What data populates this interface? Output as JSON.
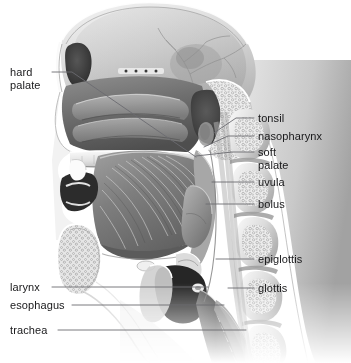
{
  "figure": {
    "name": "Mid-sagittal section of the head and neck during swallowing",
    "style": "grayscale medical illustration",
    "background_color": "#ffffff",
    "label_text_color": "#18181a",
    "leader_line_color": "#6b6b70",
    "width": 351,
    "height": 363
  },
  "labels": [
    {
      "id": "hard-palate",
      "text": "hard\npalate",
      "side": "left",
      "x": 10,
      "y": 66,
      "line": [
        [
          52,
          72
        ],
        [
          72,
          72
        ],
        [
          196,
          157
        ]
      ]
    },
    {
      "id": "larynx",
      "text": "larynx",
      "side": "left",
      "x": 10,
      "y": 281,
      "line": [
        [
          52,
          287
        ],
        [
          208,
          287
        ]
      ]
    },
    {
      "id": "esophagus",
      "text": "esophagus",
      "side": "left",
      "x": 10,
      "y": 299,
      "line": [
        [
          72,
          305
        ],
        [
          224,
          305
        ]
      ]
    },
    {
      "id": "trachea",
      "text": "trachea",
      "side": "left",
      "x": 10,
      "y": 324,
      "line": [
        [
          58,
          330
        ],
        [
          246,
          330
        ]
      ]
    },
    {
      "id": "tonsil",
      "text": "tonsil",
      "side": "right",
      "x": 258,
      "y": 112,
      "line": [
        [
          254,
          118
        ],
        [
          236,
          118
        ],
        [
          214,
          133
        ]
      ]
    },
    {
      "id": "nasopharynx",
      "text": "nasopharynx",
      "side": "right",
      "x": 258,
      "y": 130,
      "line": [
        [
          254,
          136
        ],
        [
          228,
          136
        ],
        [
          204,
          147
        ]
      ]
    },
    {
      "id": "soft-palate",
      "text": "soft\npalate",
      "side": "right",
      "x": 258,
      "y": 146,
      "line": [
        [
          254,
          152
        ],
        [
          232,
          152
        ],
        [
          196,
          156
        ]
      ]
    },
    {
      "id": "uvula",
      "text": "uvula",
      "side": "right",
      "x": 258,
      "y": 176,
      "line": [
        [
          254,
          182
        ],
        [
          212,
          182
        ]
      ]
    },
    {
      "id": "bolus",
      "text": "bolus",
      "side": "right",
      "x": 258,
      "y": 198,
      "line": [
        [
          254,
          204
        ],
        [
          206,
          204
        ]
      ]
    },
    {
      "id": "epiglottis",
      "text": "epiglottis",
      "side": "right",
      "x": 258,
      "y": 253,
      "line": [
        [
          254,
          259
        ],
        [
          216,
          259
        ]
      ]
    },
    {
      "id": "glottis",
      "text": "glottis",
      "side": "right",
      "x": 258,
      "y": 282,
      "line": [
        [
          254,
          288
        ],
        [
          228,
          288
        ]
      ]
    }
  ],
  "structures": [
    "frontal sinus",
    "cranial cavity",
    "nasal cavity",
    "nasal conchae",
    "sphenoid sinus",
    "hard palate",
    "soft palate",
    "uvula",
    "tongue",
    "mandible",
    "tonsil",
    "nasopharynx",
    "oropharynx",
    "bolus",
    "epiglottis",
    "glottis",
    "larynx",
    "esophagus",
    "trachea",
    "cervical vertebrae",
    "spinal cord"
  ]
}
